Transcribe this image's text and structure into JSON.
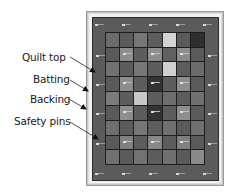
{
  "diagram": {
    "labels": [
      {
        "id": "quilt-top",
        "text": "Quilt top"
      },
      {
        "id": "batting",
        "text": "Batting"
      },
      {
        "id": "backing",
        "text": "Backing"
      },
      {
        "id": "safety-pins",
        "text": "Safety pins"
      }
    ],
    "layers": [
      "Backing",
      "Batting",
      "Quilt top"
    ],
    "grid": {
      "columns": 7,
      "rows": 9,
      "cells": [
        [
          "#6b6b6b",
          "#5a5a5a",
          "#777777",
          "#5d5d5d",
          "#d4d4d4",
          "#5a5a5a",
          "#2e2e2e"
        ],
        [
          "#5a5a5a",
          "pin:#8e8e8e",
          "#5d5d5d",
          "pin:#8e8e8e",
          "#606060",
          "pin:#8c8c8c",
          "#5a5a5a"
        ],
        [
          "#707070",
          "#5d5d5d",
          "#777777",
          "#5d5d5d",
          "#d0d0d0",
          "#5d5d5d",
          "#6b6b6b"
        ],
        [
          "#5a5a5a",
          "pin:#8e8e8e",
          "#5d5d5d",
          "pin:#333333",
          "#5d5d5d",
          "pin:#8e8e8e",
          "#5a5a5a"
        ],
        [
          "#7a7a7a",
          "#5d5d5d",
          "#c8c8c8",
          "#5d5d5d",
          "#6e6e6e",
          "#5d5d5d",
          "#707070"
        ],
        [
          "#5a5a5a",
          "pin:#8e8e8e",
          "#5d5d5d",
          "pin:#333333",
          "#5d5d5d",
          "pin:#8e8e8e",
          "#5a5a5a"
        ],
        [
          "#6e6e6e",
          "#5a5a5a",
          "#777777",
          "#5d5d5d",
          "#707070",
          "#5a5a5a",
          "#707070"
        ],
        [
          "#5a5a5a",
          "pin:#808080",
          "#5d5d5d",
          "pin:#888888",
          "#5d5d5d",
          "pin:#808080",
          "#5a5a5a"
        ],
        [
          "#707070",
          "#5a5a5a",
          "#727272",
          "#5d5d5d",
          "#707070",
          "#5a5a5a",
          "#8a8a8a"
        ]
      ]
    },
    "border_pins": {
      "top": [
        97,
        124,
        151,
        178,
        205
      ],
      "bottom": [
        97,
        124,
        151,
        178,
        205
      ],
      "left": [
        55,
        84,
        113,
        143
      ],
      "right": [
        55,
        84,
        113,
        143
      ]
    },
    "colors": {
      "border_fabric": "#5b5b5b",
      "seam": "#1e1e1e",
      "batting": "#f2f2f2",
      "backing": "#c8c8c8",
      "text": "#1a1a1a"
    }
  }
}
